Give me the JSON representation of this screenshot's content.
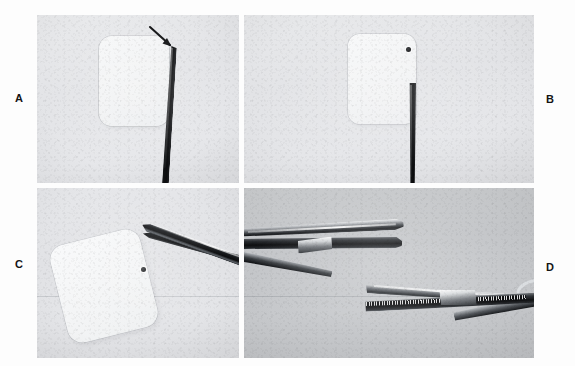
{
  "figure": {
    "type": "multi-panel-photographic-plate",
    "panel_count": 4,
    "rendering": "grayscale-photograph",
    "background_color": "#ffffff"
  },
  "labels": {
    "a": "A",
    "b": "B",
    "c": "C",
    "d": "D"
  },
  "panels": [
    {
      "id": "a",
      "label": "A",
      "label_position": "left",
      "subject": "square membrane patch with probe tip and arrow annotation",
      "annotations": [
        "arrow"
      ],
      "objects": [
        "rounded-square-patch",
        "dark-probe-instrument",
        "arrow-marker"
      ],
      "background_tone": "#e5e6e9"
    },
    {
      "id": "b",
      "label": "B",
      "label_position": "right",
      "subject": "square membrane patch with dark marker dot at upper-right corner and probe below",
      "annotations": [],
      "objects": [
        "rounded-square-patch",
        "dark-marker-dot",
        "dark-probe-instrument"
      ],
      "background_tone": "#e4e5e8"
    },
    {
      "id": "c",
      "label": "C",
      "label_position": "left",
      "subject": "tilted membrane patch grasped at corner by fine forceps tips",
      "annotations": [],
      "objects": [
        "tilted-rounded-square-patch",
        "forceps-upper-jaw",
        "forceps-lower-jaw",
        "dark-marker-dot"
      ],
      "background_tone": "#e3e4e7"
    },
    {
      "id": "d",
      "label": "D",
      "label_position": "right",
      "subject": "two surgical clamps side by side, upper with smooth jaws and lower with serrated jaws",
      "annotations": [],
      "objects": [
        "smooth-jaw-clamp",
        "serrated-jaw-clamp"
      ],
      "background_tone": "#c5c7ca"
    }
  ]
}
